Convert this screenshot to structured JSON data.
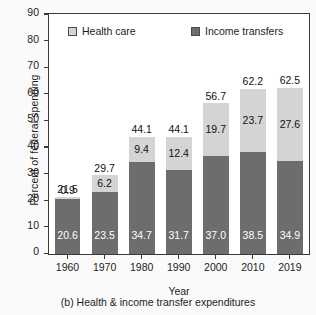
{
  "chart_data": {
    "type": "bar",
    "stacked": true,
    "title": "",
    "caption": "(b) Health & income transfer expenditures",
    "xlabel": "Year",
    "ylabel": "Percent of federal spending",
    "ylim": [
      0,
      90
    ],
    "yticks": [
      0,
      10,
      20,
      30,
      40,
      50,
      60,
      70,
      80,
      90
    ],
    "grid": false,
    "legend_position": "top-inside",
    "categories": [
      "1960",
      "1970",
      "1980",
      "1990",
      "2000",
      "2010",
      "2019"
    ],
    "series": [
      {
        "name": "Income transfers",
        "color": "#6d6d6d",
        "values": [
          20.6,
          23.5,
          34.7,
          31.7,
          37.0,
          38.5,
          34.9
        ]
      },
      {
        "name": "Health care",
        "color": "#d4d4d4",
        "values": [
          0.9,
          6.2,
          9.4,
          12.4,
          19.7,
          23.7,
          27.6
        ]
      }
    ],
    "totals": [
      21.5,
      29.7,
      44.1,
      44.1,
      56.7,
      62.2,
      62.5
    ]
  }
}
